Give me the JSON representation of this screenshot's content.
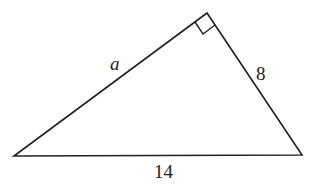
{
  "diagram": {
    "type": "right-triangle",
    "vertices": {
      "left": [
        14,
        156
      ],
      "top": [
        207,
        13
      ],
      "right": [
        302,
        155
      ]
    },
    "labels": {
      "hypotenuse": "14",
      "leg_left": "a",
      "leg_right": "8"
    },
    "right_angle_marker": true,
    "stroke_color": "#222222"
  }
}
